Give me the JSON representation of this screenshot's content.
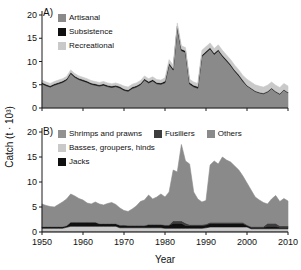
{
  "figure": {
    "panel_a_label": "A)",
    "panel_b_label": "B)",
    "ylabel": "Catch (t · 10³)",
    "xlabel": "Year"
  },
  "chart_data": [
    {
      "type": "area",
      "stacked": true,
      "panel": "A",
      "ylim": [
        0,
        20
      ],
      "yticks": [
        0,
        5,
        10,
        15,
        20
      ],
      "xticks": [
        1950,
        1960,
        1970,
        1980,
        1990,
        2000,
        2010
      ],
      "show_xtick_labels": false,
      "legend_position": "top-left-inside",
      "x": [
        1950,
        1951,
        1952,
        1953,
        1954,
        1955,
        1956,
        1957,
        1958,
        1959,
        1960,
        1961,
        1962,
        1963,
        1964,
        1965,
        1966,
        1967,
        1968,
        1969,
        1970,
        1971,
        1972,
        1973,
        1974,
        1975,
        1976,
        1977,
        1978,
        1979,
        1980,
        1981,
        1982,
        1983,
        1984,
        1985,
        1986,
        1987,
        1988,
        1989,
        1990,
        1991,
        1992,
        1993,
        1994,
        1995,
        1996,
        1997,
        1998,
        1999,
        2000,
        2001,
        2002,
        2003,
        2004,
        2005,
        2006,
        2007,
        2008,
        2009,
        2010
      ],
      "series": [
        {
          "name": "Artisanal",
          "color": "#8a8a8a",
          "values": [
            5.2,
            4.8,
            4.5,
            4.9,
            5.2,
            5.5,
            6.0,
            7.4,
            6.6,
            6.1,
            5.8,
            5.5,
            5.1,
            4.9,
            4.7,
            4.9,
            4.6,
            4.4,
            4.6,
            4.3,
            3.8,
            3.6,
            4.2,
            4.5,
            5.0,
            6.0,
            5.4,
            5.8,
            5.2,
            5.1,
            5.45,
            9.35,
            8.15,
            17.25,
            12.35,
            11.95,
            5.15,
            4.55,
            4.25,
            11.1,
            11.9,
            12.7,
            11.5,
            12.3,
            11.1,
            10.1,
            9.1,
            7.9,
            6.9,
            5.7,
            4.75,
            4.15,
            3.55,
            3.25,
            3.05,
            3.45,
            4.15,
            3.45,
            2.95,
            3.85,
            3.25
          ]
        },
        {
          "name": "Subsistence",
          "color": "#101010",
          "values": [
            0.3,
            0.3,
            0.3,
            0.3,
            0.3,
            0.3,
            0.3,
            0.3,
            0.3,
            0.3,
            0.3,
            0.3,
            0.3,
            0.3,
            0.3,
            0.3,
            0.3,
            0.3,
            0.3,
            0.3,
            0.3,
            0.3,
            0.3,
            0.3,
            0.3,
            0.3,
            0.3,
            0.3,
            0.3,
            0.3,
            0.35,
            0.35,
            0.35,
            0.35,
            0.35,
            0.35,
            0.35,
            0.35,
            0.35,
            0.3,
            0.3,
            0.3,
            0.3,
            0.3,
            0.3,
            0.3,
            0.3,
            0.3,
            0.3,
            0.3,
            0.15,
            0.15,
            0.15,
            0.15,
            0.15,
            0.15,
            0.15,
            0.15,
            0.15,
            0.15,
            0.15
          ]
        },
        {
          "name": "Recreational",
          "color": "#c9c9c9",
          "values": [
            0.5,
            0.5,
            0.5,
            0.5,
            0.5,
            0.5,
            0.5,
            0.5,
            0.5,
            0.5,
            0.5,
            0.5,
            0.5,
            0.5,
            0.5,
            0.5,
            0.5,
            0.5,
            0.5,
            0.5,
            0.6,
            0.6,
            0.6,
            0.6,
            0.6,
            0.6,
            0.6,
            0.6,
            0.6,
            0.6,
            0.7,
            0.7,
            0.7,
            0.7,
            0.7,
            0.7,
            0.7,
            0.7,
            0.7,
            1.0,
            1.0,
            1.0,
            1.0,
            1.0,
            1.0,
            1.0,
            1.0,
            1.0,
            1.0,
            1.0,
            1.3,
            1.3,
            1.3,
            1.3,
            1.3,
            1.3,
            1.3,
            1.3,
            1.3,
            1.3,
            1.3
          ]
        }
      ]
    },
    {
      "type": "area",
      "stacked": true,
      "panel": "B",
      "ylim": [
        0,
        20
      ],
      "yticks": [
        0,
        5,
        10,
        15,
        20
      ],
      "xticks": [
        1950,
        1960,
        1970,
        1980,
        1990,
        2000,
        2010
      ],
      "show_xtick_labels": true,
      "legend_position": "top-left-inside",
      "x": [
        1950,
        1951,
        1952,
        1953,
        1954,
        1955,
        1956,
        1957,
        1958,
        1959,
        1960,
        1961,
        1962,
        1963,
        1964,
        1965,
        1966,
        1967,
        1968,
        1969,
        1970,
        1971,
        1972,
        1973,
        1974,
        1975,
        1976,
        1977,
        1978,
        1979,
        1980,
        1981,
        1982,
        1983,
        1984,
        1985,
        1986,
        1987,
        1988,
        1989,
        1990,
        1991,
        1992,
        1993,
        1994,
        1995,
        1996,
        1997,
        1998,
        1999,
        2000,
        2001,
        2002,
        2003,
        2004,
        2005,
        2006,
        2007,
        2008,
        2009,
        2010
      ],
      "series": [
        {
          "name": "Shrimps and prawns",
          "color": "#919191",
          "values": [
            0.25,
            0.25,
            0.25,
            0.25,
            0.25,
            0.25,
            0.25,
            0.25,
            0.25,
            0.25,
            0.25,
            0.25,
            0.25,
            0.25,
            0.25,
            0.25,
            0.25,
            0.25,
            0.25,
            0.25,
            0.25,
            0.25,
            0.25,
            0.25,
            0.25,
            0.25,
            0.25,
            0.25,
            0.25,
            0.25,
            0.25,
            0.25,
            0.25,
            0.25,
            0.25,
            0.25,
            0.25,
            0.25,
            0.25,
            0.25,
            0.25,
            0.3,
            0.3,
            0.3,
            0.3,
            0.3,
            0.3,
            0.3,
            0.3,
            0.3,
            0.3,
            0.25,
            0.25,
            0.25,
            0.25,
            0.25,
            0.25,
            0.25,
            0.25,
            0.25,
            0.25
          ]
        },
        {
          "name": "Basses, groupers, hinds",
          "color": "#c9c9c9",
          "values": [
            0.5,
            0.5,
            0.5,
            0.5,
            0.5,
            0.5,
            0.7,
            0.9,
            0.9,
            0.9,
            0.9,
            0.9,
            0.9,
            0.9,
            0.9,
            0.9,
            0.9,
            0.9,
            0.9,
            0.6,
            0.6,
            0.6,
            0.6,
            0.6,
            0.6,
            0.6,
            0.6,
            0.6,
            0.6,
            0.6,
            0.5,
            0.5,
            0.5,
            0.5,
            0.5,
            0.5,
            0.5,
            0.5,
            0.5,
            0.5,
            0.6,
            0.7,
            0.7,
            0.7,
            0.7,
            0.7,
            0.7,
            0.7,
            0.7,
            0.7,
            0.7,
            0.4,
            0.4,
            0.4,
            0.4,
            0.4,
            0.4,
            0.4,
            0.4,
            0.4,
            0.4
          ]
        },
        {
          "name": "Jacks",
          "color": "#101010",
          "values": [
            0.3,
            0.3,
            0.3,
            0.3,
            0.3,
            0.3,
            0.3,
            0.8,
            0.8,
            0.8,
            0.8,
            0.8,
            0.8,
            0.8,
            0.5,
            0.5,
            0.5,
            0.5,
            0.5,
            0.5,
            0.5,
            0.4,
            0.4,
            0.4,
            0.4,
            0.4,
            0.6,
            0.6,
            0.6,
            0.6,
            0.6,
            0.6,
            1.0,
            1.0,
            1.0,
            0.55,
            0.55,
            0.55,
            0.55,
            0.55,
            0.55,
            0.7,
            0.7,
            0.7,
            0.7,
            0.7,
            0.7,
            0.7,
            0.7,
            0.7,
            0.3,
            0.3,
            0.3,
            0.3,
            0.3,
            0.5,
            0.5,
            0.5,
            0.3,
            0.3,
            0.3
          ]
        },
        {
          "name": "Fusiliers",
          "color": "#3d3d3d",
          "values": [
            0.05,
            0.05,
            0.05,
            0.05,
            0.05,
            0.05,
            0.05,
            0.05,
            0.05,
            0.05,
            0.05,
            0.05,
            0.05,
            0.05,
            0.05,
            0.05,
            0.05,
            0.05,
            0.05,
            0.05,
            0.1,
            0.1,
            0.1,
            0.1,
            0.1,
            0.1,
            0.1,
            0.1,
            0.1,
            0.1,
            0.1,
            0.1,
            0.5,
            0.5,
            0.5,
            0.5,
            0.2,
            0.2,
            0.2,
            0.2,
            0.2,
            0.25,
            0.25,
            0.25,
            0.25,
            0.25,
            0.25,
            0.25,
            0.25,
            0.25,
            0.15,
            0.15,
            0.15,
            0.15,
            0.15,
            0.6,
            0.6,
            0.6,
            0.3,
            0.3,
            0.3
          ]
        },
        {
          "name": "Others",
          "color": "#8a8a8a",
          "values": [
            4.5,
            4.2,
            4.0,
            3.9,
            4.4,
            4.9,
            5.3,
            5.6,
            5.2,
            4.7,
            4.4,
            3.8,
            3.6,
            4.0,
            3.9,
            3.7,
            4.0,
            4.2,
            3.8,
            3.4,
            2.85,
            2.75,
            3.25,
            3.85,
            4.75,
            5.05,
            5.85,
            5.05,
            5.45,
            6.05,
            5.55,
            6.55,
            10.15,
            9.75,
            15.25,
            12.4,
            12.1,
            6.5,
            5.1,
            4.5,
            4.7,
            11.45,
            12.25,
            11.65,
            13.05,
            12.45,
            12.05,
            11.25,
            10.45,
            9.25,
            8.35,
            7.3,
            5.9,
            5.3,
            4.8,
            3.85,
            4.85,
            5.55,
            4.85,
            5.45,
            4.95
          ]
        }
      ]
    }
  ]
}
